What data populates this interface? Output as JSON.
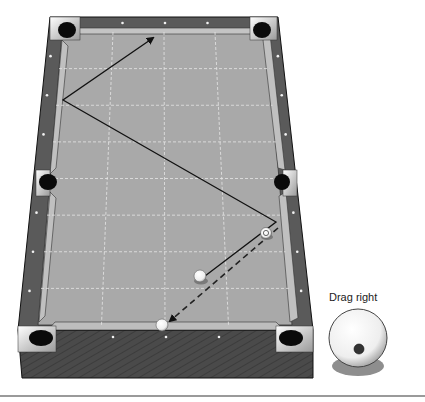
{
  "scene": {
    "title": "Pool shot diagram",
    "colors": {
      "felt": "#a9a9a9",
      "rail": "#5a5a5a",
      "cushion": "#bdbdbd",
      "frame_front": "#4a4a4a",
      "pocket": "#0a0a0a",
      "grid": "#e6e6e6",
      "path": "#111111"
    },
    "grid": {
      "columns": 4,
      "rows": 8
    },
    "balls": [
      {
        "id": "cue-ball",
        "kind": "cue"
      },
      {
        "id": "target-ball",
        "kind": "numbered",
        "number": "8"
      },
      {
        "id": "object-ball",
        "kind": "object"
      }
    ],
    "paths": [
      {
        "id": "cue-path",
        "style": "solid",
        "arrow": true
      },
      {
        "id": "object-path",
        "style": "dashed",
        "arrow": true
      }
    ]
  },
  "spin_control": {
    "label": "Drag right",
    "english": "low-right"
  }
}
